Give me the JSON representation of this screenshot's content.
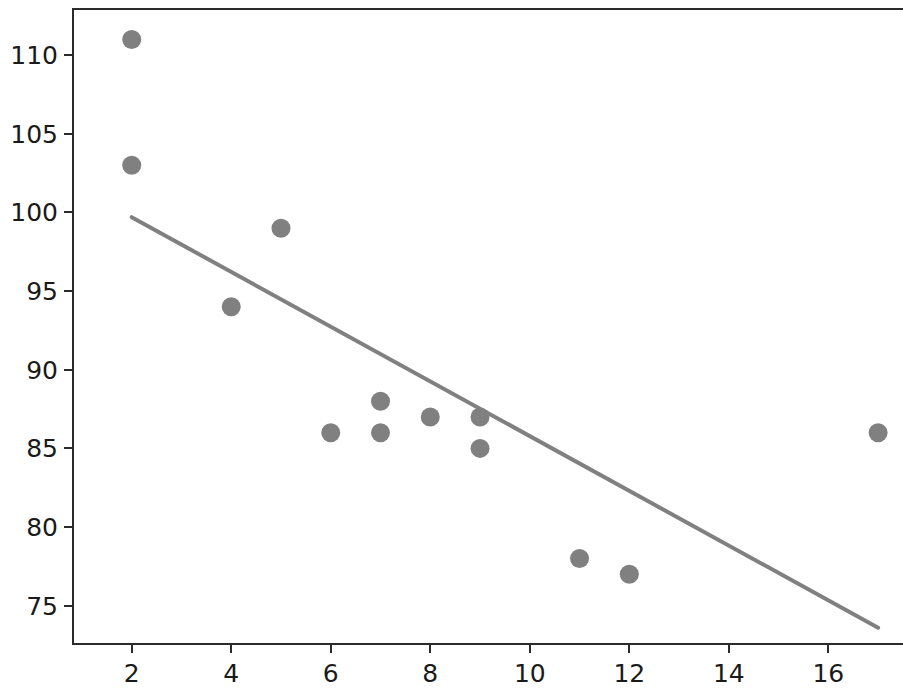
{
  "chart_data": {
    "type": "scatter",
    "title": "",
    "xlabel": "",
    "ylabel": "",
    "xlim": [
      0.8,
      17.5
    ],
    "ylim": [
      72.5,
      113.0
    ],
    "grid": false,
    "legend": "none",
    "marker_color": "#808080",
    "marker_size_px": 19,
    "line_color": "#808080",
    "line_width_px": 4,
    "xticks": [
      2,
      4,
      6,
      8,
      10,
      12,
      14,
      16
    ],
    "yticks": [
      75,
      80,
      85,
      90,
      95,
      100,
      105,
      110
    ],
    "points": [
      {
        "x": 2,
        "y": 111
      },
      {
        "x": 2,
        "y": 103
      },
      {
        "x": 4,
        "y": 94
      },
      {
        "x": 5,
        "y": 99
      },
      {
        "x": 6,
        "y": 86
      },
      {
        "x": 7,
        "y": 88
      },
      {
        "x": 7,
        "y": 86
      },
      {
        "x": 8,
        "y": 87
      },
      {
        "x": 9,
        "y": 87
      },
      {
        "x": 9,
        "y": 85
      },
      {
        "x": 11,
        "y": 78
      },
      {
        "x": 12,
        "y": 77
      },
      {
        "x": 17,
        "y": 86
      }
    ],
    "trendline": {
      "x": [
        2,
        17
      ],
      "y": [
        99.7,
        73.6
      ]
    }
  }
}
